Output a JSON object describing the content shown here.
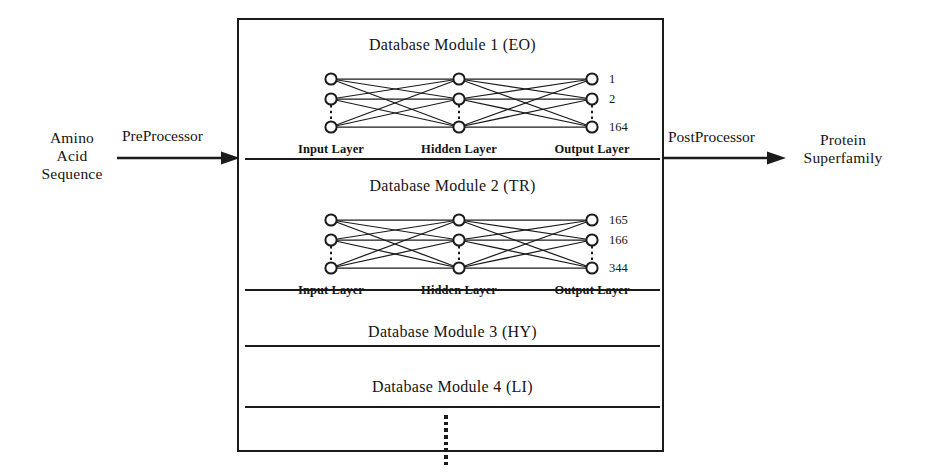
{
  "figure": {
    "background_color": "#ffffff",
    "ink_color": "#1b1b1b"
  },
  "flow": {
    "input": {
      "name": "Amino Acid Sequence",
      "lines": [
        "Amino",
        "Acid",
        "Sequence"
      ]
    },
    "pre_processor": {
      "label": "PreProcessor",
      "arrow": "right-arrow"
    },
    "post_processor": {
      "label": "PostProcessor",
      "arrow": "right-arrow"
    },
    "output": {
      "name": "Protein Superfamily",
      "lines": [
        "Protein",
        "Superfamily"
      ]
    }
  },
  "module_stack": {
    "modules": [
      {
        "title": "Database Module 1  (EO)",
        "code": "EO",
        "index": 1,
        "has_network": true,
        "network": {
          "layers": [
            {
              "name": "Input Layer",
              "label": "Input Layer",
              "nodes": 3
            },
            {
              "name": "Hidden Layer",
              "label": "Hidden Layer",
              "nodes": 3
            },
            {
              "name": "Output Layer",
              "label": "Output Layer",
              "nodes": 3
            }
          ],
          "output_labels": [
            "1",
            "2",
            "164"
          ],
          "fully_connected": true,
          "ellipsis_between_nodes": "vertical-dotted"
        }
      },
      {
        "title": "Database Module 2  (TR)",
        "code": "TR",
        "index": 2,
        "has_network": true,
        "network": {
          "layers": [
            {
              "name": "Input Layer",
              "label": "Input Layer",
              "nodes": 3
            },
            {
              "name": "Hidden Layer",
              "label": "Hidden Layer",
              "nodes": 3
            },
            {
              "name": "Output Layer",
              "label": "Output Layer",
              "nodes": 3
            }
          ],
          "output_labels": [
            "165",
            "166",
            "344"
          ],
          "fully_connected": true,
          "ellipsis_between_nodes": "vertical-dotted"
        }
      },
      {
        "title": "Database Module 3  (HY)",
        "code": "HY",
        "index": 3,
        "has_network": false
      },
      {
        "title": "Database Module 4  (LI)",
        "code": "LI",
        "index": 4,
        "has_network": false
      }
    ],
    "continuation": {
      "symbol": "vertical-ellipsis",
      "dot_count": 8
    }
  }
}
